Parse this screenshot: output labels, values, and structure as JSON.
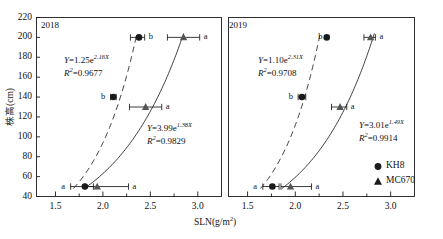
{
  "figure": {
    "axis": {
      "y_label": "株高(cm)",
      "y_ticks": [
        40,
        60,
        80,
        100,
        120,
        140,
        160,
        180,
        200,
        220
      ],
      "y_min": 40,
      "y_max": 220,
      "x_label_main": "SLN(g/m",
      "x_label_sup": "2",
      "x_label_tail": ")",
      "x_ticks": [
        "1.5",
        "2.0",
        "2.5",
        "3.0"
      ],
      "x_min": 1.3,
      "x_max": 3.25
    },
    "legend": {
      "items": [
        {
          "marker": "circle-marker",
          "label": "KH8"
        },
        {
          "marker": "triangle-marker",
          "label": "MC670"
        }
      ]
    },
    "panels": [
      {
        "year": "2018",
        "equations": [
          {
            "lhs": "Y",
            "eq": "=",
            "coef": "1.25",
            "base": "e",
            "exp": "2.16X",
            "r2_lhs": "R",
            "r2_sup": "2",
            "r2_eq": "=",
            "r2_val": "0.9677"
          },
          {
            "lhs": "Y",
            "eq": "=",
            "coef": "3.99",
            "base": "e",
            "exp": "1.38X",
            "r2_lhs": "R",
            "r2_sup": "2",
            "r2_eq": "=",
            "r2_val": "0.9829"
          }
        ]
      },
      {
        "year": "2019",
        "equations": [
          {
            "lhs": "Y",
            "eq": "=",
            "coef": "1.10",
            "base": "e",
            "exp": "2.31X",
            "r2_lhs": "R",
            "r2_sup": "2",
            "r2_eq": "=",
            "r2_val": "0.9708"
          },
          {
            "lhs": "Y",
            "eq": "=",
            "coef": "3.01",
            "base": "e",
            "exp": "1.49X",
            "r2_lhs": "R",
            "r2_sup": "2",
            "r2_eq": "=",
            "r2_val": "0.9914"
          }
        ]
      }
    ]
  },
  "chart_data": {
    "type": "scatter",
    "title": "",
    "xlabel": "SLN(g/m2)",
    "ylabel": "株高(cm)",
    "xlim": [
      1.3,
      3.25
    ],
    "ylim": [
      40,
      220
    ],
    "grid": false,
    "legend_position": "bottom-right",
    "panels": [
      {
        "name": "2018",
        "series": [
          {
            "name": "KH8",
            "marker": "circle",
            "fit_label": "Y=1.25e^2.16X",
            "fit_r2": "R2=0.9677",
            "fit_a": 1.25,
            "fit_b": 2.16,
            "points": [
              {
                "x": 2.38,
                "y": 200,
                "xerr_low": 0.09,
                "xerr_high": 0.06,
                "letter": "b",
                "letter_side": "right"
              },
              {
                "x": 2.11,
                "y": 140,
                "xerr_low": 0.03,
                "xerr_high": 0.03,
                "letter": "b",
                "letter_side": "left"
              },
              {
                "x": 1.81,
                "y": 50,
                "xerr_low": 0.15,
                "xerr_high": 0.09,
                "letter": "a",
                "letter_side": "left"
              }
            ]
          },
          {
            "name": "MC670",
            "marker": "triangle",
            "fit_label": "Y=3.99e^1.38X",
            "fit_r2": "R2=0.9829",
            "fit_a": 3.99,
            "fit_b": 1.38,
            "points": [
              {
                "x": 2.85,
                "y": 200,
                "xerr_low": 0.17,
                "xerr_high": 0.17,
                "letter": "a",
                "letter_side": "right"
              },
              {
                "x": 2.45,
                "y": 130,
                "xerr_low": 0.17,
                "xerr_high": 0.17,
                "letter": "a",
                "letter_side": "right"
              },
              {
                "x": 1.94,
                "y": 50,
                "xerr_low": 0.13,
                "xerr_high": 0.33,
                "letter": "a",
                "letter_side": "right"
              }
            ]
          }
        ]
      },
      {
        "name": "2019",
        "series": [
          {
            "name": "KH8",
            "marker": "circle",
            "fit_label": "Y=1.10e^2.31X",
            "fit_r2": "R2=0.9708",
            "fit_a": 1.1,
            "fit_b": 2.31,
            "points": [
              {
                "x": 2.33,
                "y": 200,
                "xerr_low": 0.0,
                "xerr_high": 0.0,
                "letter": "b",
                "letter_side": "left"
              },
              {
                "x": 2.07,
                "y": 140,
                "xerr_low": 0.04,
                "xerr_high": 0.04,
                "letter": "b",
                "letter_side": "left"
              },
              {
                "x": 1.76,
                "y": 50,
                "xerr_low": 0.1,
                "xerr_high": 0.07,
                "letter": "a",
                "letter_side": "left"
              }
            ]
          },
          {
            "name": "MC670",
            "marker": "triangle",
            "fit_label": "Y=3.01e^1.49X",
            "fit_r2": "R2=0.9914",
            "fit_a": 3.01,
            "fit_b": 1.49,
            "points": [
              {
                "x": 2.79,
                "y": 200,
                "xerr_low": 0.07,
                "xerr_high": 0.05,
                "letter": "a",
                "letter_side": "right"
              },
              {
                "x": 2.47,
                "y": 130,
                "xerr_low": 0.09,
                "xerr_high": 0.07,
                "letter": "a",
                "letter_side": "right"
              },
              {
                "x": 1.95,
                "y": 50,
                "xerr_low": 0.1,
                "xerr_high": 0.22,
                "letter": "a",
                "letter_side": "right"
              }
            ]
          }
        ]
      }
    ]
  }
}
